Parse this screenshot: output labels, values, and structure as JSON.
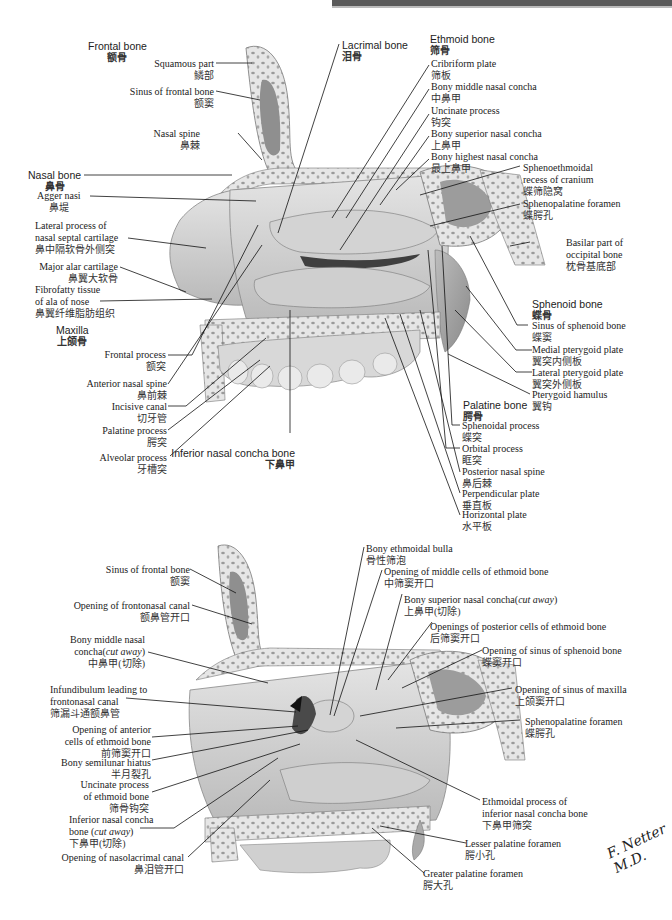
{
  "header": {
    "bar_color": "#5a5a5a"
  },
  "figure_top": {
    "frontal_bone": {
      "en": "Frontal bone",
      "zh": "额骨"
    },
    "squamous_part": {
      "en": "Squamous part",
      "zh": "鳞部"
    },
    "sinus_frontal": {
      "en": "Sinus of frontal bone",
      "zh": "额窦"
    },
    "nasal_spine": {
      "en": "Nasal spine",
      "zh": "鼻棘"
    },
    "nasal_bone": {
      "en": "Nasal bone",
      "zh": "鼻骨"
    },
    "agger_nasi": {
      "en": "Agger nasi",
      "zh": "鼻堤"
    },
    "lateral_process": {
      "en1": "Lateral process of",
      "en2": "nasal septal cartilage",
      "zh": "鼻中隔软骨外侧突"
    },
    "major_alar": {
      "en": "Major alar cartilage",
      "zh": "鼻翼大软骨"
    },
    "fibrofatty": {
      "en1": "Fibrofatty tissue",
      "en2": "of ala of nose",
      "zh": "鼻翼纤维脂肪组织"
    },
    "maxilla": {
      "en": "Maxilla",
      "zh": "上颌骨"
    },
    "frontal_process": {
      "en": "Frontal process",
      "zh": "额突"
    },
    "anterior_nasal_spine": {
      "en": "Anterior nasal spine",
      "zh": "鼻前棘"
    },
    "incisive_canal": {
      "en": "Incisive canal",
      "zh": "切牙管"
    },
    "palatine_process": {
      "en": "Palatine process",
      "zh": "腭突"
    },
    "alveolar_process": {
      "en": "Alveolar process",
      "zh": "牙槽突"
    },
    "inferior_concha": {
      "en": "Inferior nasal concha bone",
      "zh": "下鼻甲"
    },
    "lacrimal_bone": {
      "en": "Lacrimal bone",
      "zh": "泪骨"
    },
    "ethmoid_bone": {
      "en": "Ethmoid bone",
      "zh": "筛骨"
    },
    "cribriform": {
      "en": "Cribriform plate",
      "zh": "筛板"
    },
    "bony_middle": {
      "en": "Bony middle nasal concha",
      "zh": "中鼻甲"
    },
    "uncinate": {
      "en": "Uncinate process",
      "zh": "钩突"
    },
    "bony_superior": {
      "en": "Bony superior nasal concha",
      "zh": "上鼻甲"
    },
    "bony_highest": {
      "en": "Bony highest nasal concha",
      "zh": "最上鼻甲"
    },
    "sphenoethmoidal": {
      "en1": "Sphenoethmoidal",
      "en2": "recess of cranium",
      "zh": "蝶筛隐窝"
    },
    "sphenopalatine": {
      "en": "Sphenopalatine foramen",
      "zh": "蝶腭孔"
    },
    "basilar": {
      "en1": "Basilar part of",
      "en2": "occipital bone",
      "zh": "枕骨基底部"
    },
    "sphenoid_bone": {
      "en": "Sphenoid bone",
      "zh": "蝶骨"
    },
    "sinus_sphenoid": {
      "en": "Sinus of sphenoid bone",
      "zh": "蝶窦"
    },
    "medial_pterygoid": {
      "en": "Medial pterygoid plate",
      "zh": "翼突内侧板"
    },
    "lateral_pterygoid": {
      "en": "Lateral pterygoid plate",
      "zh": "翼突外侧板"
    },
    "pterygoid_hamulus": {
      "en": "Pterygoid hamulus",
      "zh": "翼钩"
    },
    "palatine_bone": {
      "en": "Palatine bone",
      "zh": "腭骨"
    },
    "sphenoidal_process": {
      "en": "Sphenoidal process",
      "zh": "蝶突"
    },
    "orbital_process": {
      "en": "Orbital process",
      "zh": "眶突"
    },
    "posterior_nasal_spine": {
      "en": "Posterior nasal spine",
      "zh": "鼻后棘"
    },
    "perpendicular_plate": {
      "en": "Perpendicular plate",
      "zh": "垂直板"
    },
    "horizontal_plate": {
      "en": "Horizontal plate",
      "zh": "水平板"
    }
  },
  "figure_bottom": {
    "sinus_frontal": {
      "en": "Sinus of frontal bone",
      "zh": "额窦"
    },
    "frontonasal_opening": {
      "en": "Opening of frontonasal canal",
      "zh": "额鼻管开口"
    },
    "middle_concha_cut": {
      "en1": "Bony middle nasal",
      "en2a": "concha(",
      "en2i": "cut away",
      "en2b": ")",
      "zh": "中鼻甲(切除)"
    },
    "infundibulum": {
      "en1": "Infundibulum leading to",
      "en2": "frontonasal canal",
      "zh": "筛漏斗通额鼻管"
    },
    "anterior_cells": {
      "en1": "Opening of anterior",
      "en2": "cells of ethmoid bone",
      "zh": "前筛窦开口"
    },
    "semilunar": {
      "en": "Bony semilunar hiatus",
      "zh": "半月裂孔"
    },
    "uncinate_ethmoid": {
      "en1": "Uncinate process",
      "en2": "of ethmoid bone",
      "zh": "筛骨钩突"
    },
    "inferior_concha_cut": {
      "en1": "Inferior nasal concha",
      "en2a": "bone (",
      "en2i": "cut away",
      "en2b": ")",
      "zh": "下鼻甲(切除)"
    },
    "nasolacrimal": {
      "en": "Opening of nasolacrimal canal",
      "zh": "鼻泪管开口"
    },
    "ethmoidal_bulla": {
      "en": "Bony ethmoidal bulla",
      "zh": "骨性筛泡"
    },
    "middle_cells": {
      "en": "Opening of middle cells of ethmoid bone",
      "zh": "中筛窦开口"
    },
    "superior_concha_cut": {
      "en1": "Bony superior nasal concha(",
      "eni": "cut away",
      "en2": ")",
      "zh": "上鼻甲(切除)"
    },
    "posterior_cells": {
      "en": "Openings of posterior cells of ethmoid bone",
      "zh": "后筛窦开口"
    },
    "sphenoid_sinus_opening": {
      "en": "Opening of sinus of sphenoid bone",
      "zh": "蝶窦开口"
    },
    "maxilla_sinus_opening": {
      "en": "Opening of sinus of maxilla",
      "zh": "上颌窦开口"
    },
    "sphenopalatine": {
      "en": "Sphenopalatine foramen",
      "zh": "蝶腭孔"
    },
    "ethmoidal_process": {
      "en1": "Ethmoidal process of",
      "en2": "inferior nasal concha bone",
      "zh": "下鼻甲筛突"
    },
    "lesser_palatine": {
      "en": "Lesser palatine foramen",
      "zh": "腭小孔"
    },
    "greater_palatine": {
      "en": "Greater palatine foramen",
      "zh": "腭大孔"
    }
  },
  "signature": {
    "text": "F. Netter M.D."
  }
}
